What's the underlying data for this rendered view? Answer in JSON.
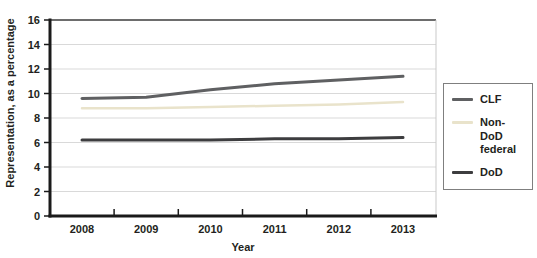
{
  "figure": {
    "background": "#ffffff",
    "axis_color": "#1a1a1a",
    "gridline_color": "#d9d9d9",
    "plot_border_right_color": "#c9c9c9",
    "plot_border_top_color": "#3c3c3c"
  },
  "chart_data": {
    "type": "line",
    "title": "",
    "xlabel": "Year",
    "ylabel": "Representation, as a percentage",
    "x": [
      "2008",
      "2009",
      "2010",
      "2011",
      "2012",
      "2013"
    ],
    "ylim": [
      0,
      16
    ],
    "yticks": [
      0,
      2,
      4,
      6,
      8,
      10,
      12,
      14,
      16
    ],
    "grid": true,
    "legend_position": "right",
    "series": [
      {
        "name": "CLF",
        "color": "#5f6062",
        "stroke_width": 3,
        "values": [
          9.6,
          9.7,
          10.3,
          10.8,
          11.1,
          11.4
        ]
      },
      {
        "name": "Non-DoD federal",
        "color": "#e9e3cb",
        "stroke_width": 2.5,
        "values": [
          8.8,
          8.8,
          8.9,
          9.0,
          9.1,
          9.3
        ]
      },
      {
        "name": "DoD",
        "color": "#3d3d3f",
        "stroke_width": 3,
        "values": [
          6.2,
          6.2,
          6.2,
          6.3,
          6.3,
          6.4
        ]
      }
    ]
  },
  "legend": {
    "items": [
      "CLF",
      "Non-DoD federal",
      "DoD"
    ]
  }
}
